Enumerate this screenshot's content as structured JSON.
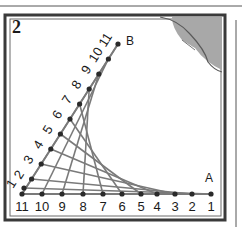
{
  "figure": {
    "number": "2",
    "point_a_label": "A",
    "point_b_label": "B",
    "bottom_labels": [
      "11",
      "10",
      "9",
      "8",
      "7",
      "6",
      "5",
      "4",
      "3",
      "2",
      "1"
    ],
    "diagonal_labels": [
      "1",
      "2",
      "3",
      "4",
      "5",
      "6",
      "7",
      "8",
      "9",
      "10",
      "11"
    ],
    "colors": {
      "frame": "#3a3a3a",
      "thread": "#7a7a7a",
      "corner_fill": "#a8a8a8",
      "dot": "#2a2a2a"
    }
  }
}
